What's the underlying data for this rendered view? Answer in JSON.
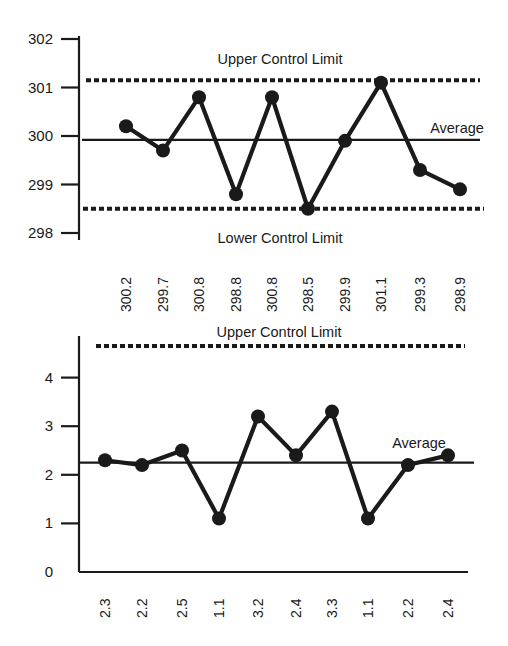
{
  "chart_data": [
    {
      "type": "line",
      "title": "",
      "xlabel": "",
      "ylabel": "",
      "categories": [
        "300.2",
        "299.7",
        "300.8",
        "298.8",
        "300.8",
        "298.5",
        "299.9",
        "301.1",
        "299.3",
        "298.9"
      ],
      "values": [
        300.2,
        299.7,
        300.8,
        298.8,
        300.8,
        298.5,
        299.9,
        301.1,
        299.3,
        298.9
      ],
      "ylim": [
        298,
        302
      ],
      "yticks": [
        298,
        299,
        300,
        301,
        302
      ],
      "grid": false,
      "reference_lines": [
        {
          "name": "Upper Control Limit",
          "value": 301.15,
          "style": "dashed"
        },
        {
          "name": "Average",
          "value": 299.92,
          "style": "solid"
        },
        {
          "name": "Lower Control Limit",
          "value": 298.5,
          "style": "dashed"
        }
      ],
      "annotations": [
        "Upper Control Limit",
        "Average",
        "Lower Control Limit"
      ]
    },
    {
      "type": "line",
      "title": "",
      "xlabel": "",
      "ylabel": "",
      "categories": [
        "2.3",
        "2.2",
        "2.5",
        "1.1",
        "3.2",
        "2.4",
        "3.3",
        "1.1",
        "2.2",
        "2.4"
      ],
      "values": [
        2.3,
        2.2,
        2.5,
        1.1,
        3.2,
        2.4,
        3.3,
        1.1,
        2.2,
        2.4
      ],
      "ylim": [
        0,
        4.7
      ],
      "yticks": [
        0,
        1,
        2,
        3,
        4
      ],
      "grid": false,
      "reference_lines": [
        {
          "name": "Upper Control Limit",
          "value": 4.65,
          "style": "dashed"
        },
        {
          "name": "Average",
          "value": 2.25,
          "style": "solid"
        }
      ],
      "annotations": [
        "Upper Control Limit",
        "Average"
      ]
    }
  ]
}
